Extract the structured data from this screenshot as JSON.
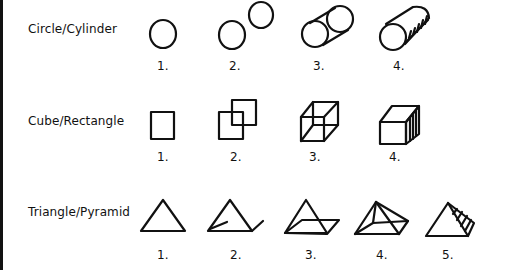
{
  "figure": {
    "rows": [
      {
        "label": "Circle/Cylinder",
        "items": [
          "1.",
          "2.",
          "3.",
          "4."
        ],
        "descriptions": [
          "circle",
          "two offset circles",
          "two circles joined by tangent lines (wireframe cylinder)",
          "shaded solid cylinder"
        ]
      },
      {
        "label": "Cube/Rectangle",
        "items": [
          "1.",
          "2.",
          "3.",
          "4."
        ],
        "descriptions": [
          "square",
          "two overlapping offset squares",
          "wireframe cube",
          "shaded solid cube"
        ]
      },
      {
        "label": "Triangle/Pyramid",
        "items": [
          "1.",
          "2.",
          "3.",
          "4.",
          "5."
        ],
        "descriptions": [
          "triangle",
          "triangle with receding edge strokes",
          "triangle with parallelogram base",
          "wireframe pyramid",
          "shaded solid pyramid"
        ]
      }
    ]
  }
}
